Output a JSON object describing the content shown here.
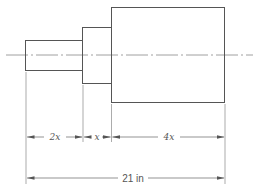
{
  "diagram": {
    "type": "stepped-shaft-dimension-drawing",
    "colors": {
      "line": "#555555",
      "background": "#ffffff"
    },
    "sections": [
      {
        "name": "small-section",
        "length_label": "2x"
      },
      {
        "name": "middle-section",
        "length_label": "x"
      },
      {
        "name": "large-section",
        "length_label": "4x"
      }
    ],
    "dimensions": {
      "segment_labels": [
        "2x",
        "x",
        "4x"
      ],
      "total_label": "21 in"
    }
  }
}
